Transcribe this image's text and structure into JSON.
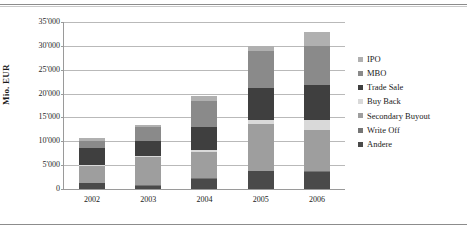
{
  "chart_data": {
    "type": "bar",
    "subtype": "stacked-bar",
    "title": "",
    "xlabel": "",
    "ylabel": "Mio. EUR",
    "categories": [
      "2002",
      "2003",
      "2004",
      "2005",
      "2006"
    ],
    "ylim": [
      0,
      35000
    ],
    "ytick_step": 5000,
    "yticks": [
      "0",
      "5'000",
      "10'000",
      "15'000",
      "20'000",
      "25'000",
      "30'000",
      "35'000"
    ],
    "ytick_values": [
      0,
      5000,
      10000,
      15000,
      20000,
      25000,
      30000,
      35000
    ],
    "grid": true,
    "legend_position": "right",
    "stack_order_bottom_up": [
      "Andere",
      "Write Off",
      "Secondary Buyout",
      "Buy Back",
      "Trade Sale",
      "MBO",
      "IPO"
    ],
    "series": [
      {
        "name": "IPO",
        "color": "#b0b0b0",
        "values": [
          600,
          500,
          1000,
          1000,
          3000
        ]
      },
      {
        "name": "MBO",
        "color": "#8a8a8a",
        "values": [
          1400,
          2900,
          5500,
          7800,
          8200
        ]
      },
      {
        "name": "Trade Sale",
        "color": "#3f3f3f",
        "values": [
          3700,
          3000,
          4700,
          6700,
          7300
        ]
      },
      {
        "name": "Buy Back",
        "color": "#d9d9d9",
        "values": [
          200,
          200,
          400,
          700,
          2200
        ]
      },
      {
        "name": "Secondary Buyout",
        "color": "#9e9e9e",
        "values": [
          3500,
          6000,
          5500,
          9900,
          8600
        ]
      },
      {
        "name": "Write Off",
        "color": "#757575",
        "values": [
          100,
          100,
          100,
          100,
          100
        ]
      },
      {
        "name": "Andere",
        "color": "#4a4a4a",
        "values": [
          1200,
          700,
          2200,
          3700,
          3600
        ]
      }
    ],
    "totals": [
      10700,
      13400,
      19400,
      29900,
      33000
    ]
  },
  "legend": {
    "items": [
      {
        "label": "IPO"
      },
      {
        "label": "MBO"
      },
      {
        "label": "Trade Sale"
      },
      {
        "label": "Buy Back"
      },
      {
        "label": "Secondary Buyout"
      },
      {
        "label": "Write Off"
      },
      {
        "label": "Andere"
      }
    ]
  }
}
